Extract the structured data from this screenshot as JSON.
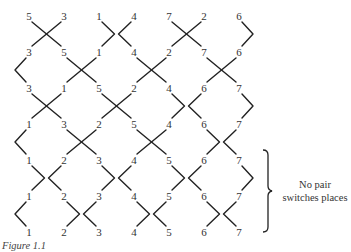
{
  "diagram": {
    "type": "odd-even transposition sorting network",
    "rows": [
      [
        5,
        3,
        1,
        4,
        7,
        2,
        6
      ],
      [
        3,
        5,
        1,
        4,
        2,
        7,
        6
      ],
      [
        3,
        1,
        5,
        2,
        4,
        6,
        7
      ],
      [
        1,
        3,
        2,
        5,
        4,
        6,
        7
      ],
      [
        1,
        2,
        3,
        4,
        5,
        6,
        7
      ],
      [
        1,
        2,
        3,
        4,
        5,
        6,
        7
      ],
      [
        1,
        2,
        3,
        4,
        5,
        6,
        7
      ]
    ],
    "annotation": {
      "line1": "No pair",
      "line2": "switches places"
    },
    "caption": "Figure 1.1"
  }
}
